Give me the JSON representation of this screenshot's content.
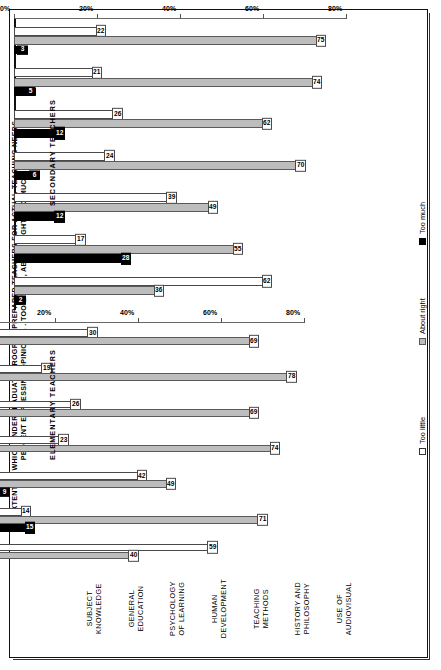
{
  "title": "EXTENT TO WHICH UNDERGRADUATE PROGRAM PREPARED TEACHERS FOR ACTUAL TEACHING NEEDS,\nPERCENT EXPRESSING OPINION . . . TOO LITTLE, ABOUT RIGHT, TOO MUCH",
  "panels": {
    "secondary_label": "SECONDARY TEACHERS",
    "elementary_label": "ELEMENTARY TEACHERS"
  },
  "legend": {
    "items": [
      {
        "key": "little",
        "label": "Too little",
        "color": "#ffffff"
      },
      {
        "key": "right",
        "label": "About right",
        "color": "#bdbdbd"
      },
      {
        "key": "much",
        "label": "Too much",
        "color": "#000000"
      }
    ]
  },
  "axis": {
    "ticks": [
      "0%",
      "20%",
      "40%",
      "60%",
      "80%"
    ],
    "values": [
      0,
      20,
      40,
      60,
      80
    ],
    "max": 80
  },
  "categories": [
    "SUBJECT\nKNOWLEDGE",
    "GENERAL\nEDUCATION",
    "PSYCHOLOGY\nOF LEARNING",
    "HUMAN\nDEVELOPMENT",
    "TEACHING\nMETHODS",
    "HISTORY AND\nPHILOSOPHY",
    "USE OF\nAUDIOVISUAL"
  ],
  "chart_data": [
    {
      "type": "bar",
      "title": "SECONDARY TEACHERS",
      "xlabel": "",
      "ylabel": "Percent",
      "ylim": [
        0,
        80
      ],
      "grid": false,
      "legend_position": "right",
      "categories": [
        "SUBJECT KNOWLEDGE",
        "GENERAL EDUCATION",
        "PSYCHOLOGY OF LEARNING",
        "HUMAN DEVELOPMENT",
        "TEACHING METHODS",
        "HISTORY AND PHILOSOPHY",
        "USE OF AUDIOVISUAL"
      ],
      "series": [
        {
          "name": "Too little",
          "values": [
            22,
            21,
            26,
            24,
            39,
            17,
            62
          ]
        },
        {
          "name": "About right",
          "values": [
            75,
            74,
            62,
            70,
            49,
            55,
            36
          ]
        },
        {
          "name": "Too much",
          "values": [
            3,
            5,
            12,
            6,
            12,
            28,
            2
          ]
        }
      ]
    },
    {
      "type": "bar",
      "title": "ELEMENTARY TEACHERS",
      "xlabel": "",
      "ylabel": "Percent",
      "ylim": [
        0,
        80
      ],
      "grid": false,
      "legend_position": "right",
      "categories": [
        "SUBJECT KNOWLEDGE",
        "GENERAL EDUCATION",
        "PSYCHOLOGY OF LEARNING",
        "HUMAN DEVELOPMENT",
        "TEACHING METHODS",
        "HISTORY AND PHILOSOPHY",
        "USE OF AUDIOVISUAL"
      ],
      "series": [
        {
          "name": "Too little",
          "values": [
            30,
            19,
            26,
            23,
            42,
            14,
            59
          ]
        },
        {
          "name": "About right",
          "values": [
            69,
            78,
            69,
            74,
            49,
            71,
            40
          ]
        },
        {
          "name": "Too much",
          "values": [
            1,
            3,
            5,
            3,
            9,
            15,
            1
          ]
        }
      ]
    }
  ]
}
